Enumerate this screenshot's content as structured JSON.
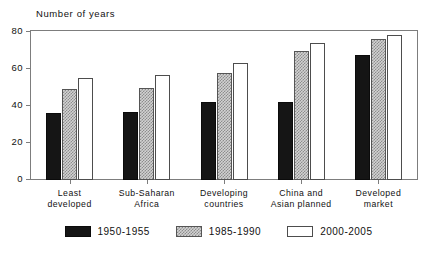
{
  "chart_data": {
    "type": "bar",
    "title": "",
    "ylabel": "Number of years",
    "xlabel": "",
    "ylim": [
      0,
      80
    ],
    "yticks": [
      0,
      20,
      40,
      60,
      80
    ],
    "ytick_labels": [
      "0",
      "20",
      "40",
      "60",
      "80"
    ],
    "grid": false,
    "frame": true,
    "legend_position": "bottom-center",
    "categories": [
      "Least\ndeveloped",
      "Sub-Saharan\nAfrica",
      "Developing\ncountries",
      "China and\nAsian planned",
      "Developed\nmarket"
    ],
    "category_lines": [
      [
        "Least",
        "developed"
      ],
      [
        "Sub-Saharan",
        "Africa"
      ],
      [
        "Developing",
        "countries"
      ],
      [
        "China and",
        "Asian planned"
      ],
      [
        "Developed",
        "market"
      ]
    ],
    "series": [
      {
        "name": "1950-1955",
        "fill": "solid-black",
        "color": "#151515",
        "values": [
          36,
          37,
          42,
          42,
          67.5
        ]
      },
      {
        "name": "1985-1990",
        "fill": "gray-checker-hatch",
        "color": "#d2d2d2",
        "values": [
          49,
          50,
          58,
          69.5,
          76
        ]
      },
      {
        "name": "2000-2005",
        "fill": "white-outline",
        "color": "#ffffff",
        "values": [
          55,
          56.5,
          63.5,
          74,
          78.5
        ]
      }
    ]
  },
  "legend": {
    "items": [
      {
        "label": "1950-1955"
      },
      {
        "label": "1985-1990"
      },
      {
        "label": "2000-2005"
      }
    ]
  },
  "axis": {
    "y_title": "Number of years"
  }
}
